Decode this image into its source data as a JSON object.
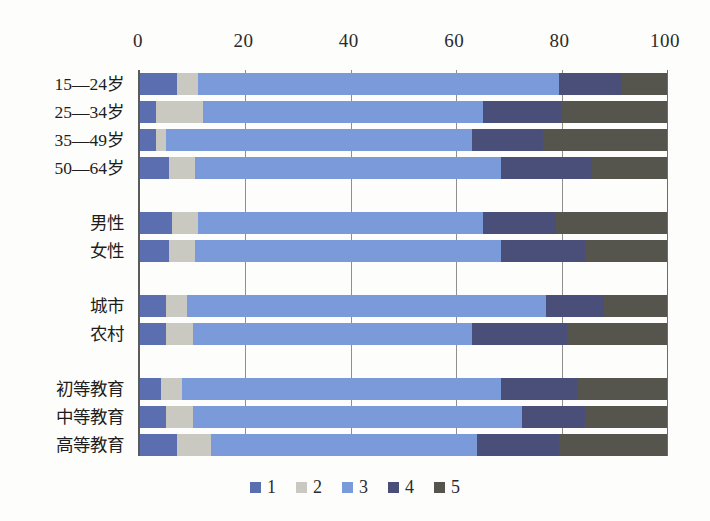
{
  "chart_data": {
    "type": "bar",
    "orientation": "horizontal",
    "stacked": true,
    "title": "",
    "subtitle": "",
    "xlabel": "",
    "ylabel": "",
    "xlim": [
      0,
      100
    ],
    "xticks": [
      "0",
      "20",
      "40",
      "60",
      "80",
      "100"
    ],
    "xtick_values": [
      0,
      20,
      40,
      60,
      80,
      100
    ],
    "grid": true,
    "legend_position": "bottom",
    "legend": [
      "1",
      "2",
      "3",
      "4",
      "5"
    ],
    "categories": [
      "15—24岁",
      "25—34岁",
      "35—49岁",
      "50—64岁",
      "男性",
      "女性",
      "城市",
      "农村",
      "初等教育",
      "中等教育",
      "高等教育"
    ],
    "group_breaks_after": [
      3,
      5,
      7
    ],
    "series": [
      {
        "name": "1",
        "color": "#5b6fb0",
        "values": [
          7.0,
          3.0,
          3.0,
          5.5,
          6.0,
          5.5,
          5.0,
          5.0,
          4.0,
          5.0,
          7.0
        ]
      },
      {
        "name": "2",
        "color": "#c9c8c1",
        "values": [
          4.0,
          9.0,
          2.0,
          5.0,
          5.0,
          5.0,
          4.0,
          5.0,
          4.0,
          5.0,
          6.5
        ]
      },
      {
        "name": "3",
        "color": "#7b9ad9",
        "values": [
          68.5,
          53.0,
          58.0,
          58.0,
          54.0,
          58.0,
          68.0,
          53.0,
          60.5,
          62.5,
          50.5
        ]
      },
      {
        "name": "4",
        "color": "#4a4f79",
        "values": [
          12.0,
          15.0,
          13.5,
          17.0,
          14.0,
          16.0,
          11.0,
          18.0,
          14.5,
          12.0,
          15.5
        ]
      },
      {
        "name": "5",
        "color": "#55554e",
        "values": [
          8.5,
          20.0,
          23.5,
          14.5,
          21.0,
          15.5,
          12.0,
          19.0,
          17.0,
          15.5,
          20.5
        ]
      }
    ]
  },
  "colors": {
    "background": "#fdfdfb",
    "axis": "#5a5a5a",
    "gridline": "#8f8f8f",
    "text": "#1d1d1d"
  }
}
